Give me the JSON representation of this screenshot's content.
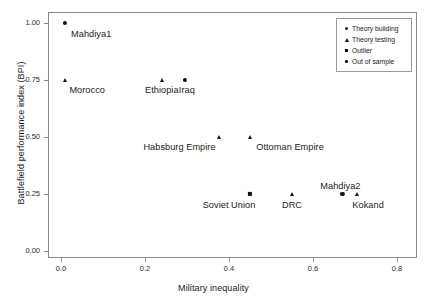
{
  "chart_data": {
    "type": "scatter",
    "title": "",
    "xlabel": "Military inequality",
    "ylabel": "Battlefield performance index (BPI)",
    "xlim": [
      -0.04,
      0.84
    ],
    "ylim": [
      -0.04,
      1.06
    ],
    "xticks": [
      "0.0",
      "0.2",
      "0.4",
      "0.6",
      "0.8"
    ],
    "xtick_values": [
      0.0,
      0.2,
      0.4,
      0.6,
      0.8
    ],
    "yticks": [
      "0.00",
      "0.25",
      "0.50",
      "0.75",
      "1.00"
    ],
    "ytick_values": [
      0.0,
      0.25,
      0.5,
      0.75,
      1.0
    ],
    "grid": false,
    "legend_position": "top-right",
    "legend": [
      {
        "label": "Theory building",
        "marker": "circle"
      },
      {
        "label": "Theory testing",
        "marker": "triangle"
      },
      {
        "label": "Outlier",
        "marker": "square"
      },
      {
        "label": "Out of sample",
        "marker": "dot"
      }
    ],
    "points": [
      {
        "label": "Mahdiya1",
        "x": 0.01,
        "y": 1.0,
        "marker": "circle",
        "series": "Theory building",
        "label_dx": 26,
        "label_dy": 6
      },
      {
        "label": "Morocco",
        "x": 0.01,
        "y": 0.75,
        "marker": "triangle",
        "series": "Theory testing",
        "label_dx": 22,
        "label_dy": 5
      },
      {
        "label": "Ethiopia",
        "x": 0.24,
        "y": 0.75,
        "marker": "triangle",
        "series": "Theory testing",
        "label_dx": 0,
        "label_dy": 5
      },
      {
        "label": "Iraq",
        "x": 0.295,
        "y": 0.75,
        "marker": "circle",
        "series": "Theory building",
        "label_dx": 2,
        "label_dy": 5
      },
      {
        "label": "Habsburg Empire",
        "x": 0.375,
        "y": 0.5,
        "marker": "triangle",
        "series": "Theory testing",
        "label_dx": -39,
        "label_dy": 5
      },
      {
        "label": "Ottoman Empire",
        "x": 0.45,
        "y": 0.5,
        "marker": "triangle",
        "series": "Theory testing",
        "label_dx": 40,
        "label_dy": 5
      },
      {
        "label": "Soviet Union",
        "x": 0.45,
        "y": 0.25,
        "marker": "square",
        "series": "Outlier",
        "label_dx": -21,
        "label_dy": 6
      },
      {
        "label": "DRC",
        "x": 0.55,
        "y": 0.25,
        "marker": "triangle",
        "series": "Theory testing",
        "label_dx": 0,
        "label_dy": 6
      },
      {
        "label": "Mahdiya2",
        "x": 0.67,
        "y": 0.25,
        "marker": "circle",
        "series": "Theory building",
        "label_dx": -2,
        "label_dy": -13
      },
      {
        "label": "Kokand",
        "x": 0.705,
        "y": 0.25,
        "marker": "triangle",
        "series": "Theory testing",
        "label_dx": 11,
        "label_dy": 6
      }
    ]
  },
  "colors": {
    "marker": "#111111",
    "frame": "#8a8a8a",
    "text": "#1a1a1a",
    "background": "#ffffff"
  }
}
